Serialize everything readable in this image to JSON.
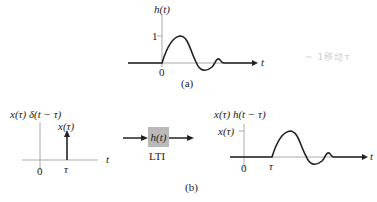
{
  "figure": {
    "panel_a": {
      "ylabel": "h(t)",
      "xlabel": "t",
      "y_tick": "1",
      "x_tick": "0",
      "caption": "(a)"
    },
    "panel_b": {
      "input": {
        "ylabel": "x(τ) δ(t − τ)",
        "impulse_label": "x(τ)",
        "x_tick_origin": "0",
        "x_tick_tau": "τ",
        "xlabel": "t"
      },
      "system": {
        "box_label": "h(t)",
        "type_label": "LTI"
      },
      "output": {
        "ylabel": "x(τ) h(t − τ)",
        "y_tick": "x(τ)",
        "x_tick_origin": "0",
        "x_tick_tau": "τ",
        "xlabel": "t"
      },
      "caption": "(b)"
    },
    "handwritten_note": "~ 1移动τ",
    "colors": {
      "stroke": "#222222",
      "axis": "#999999",
      "box": "#b9b9b9"
    }
  }
}
